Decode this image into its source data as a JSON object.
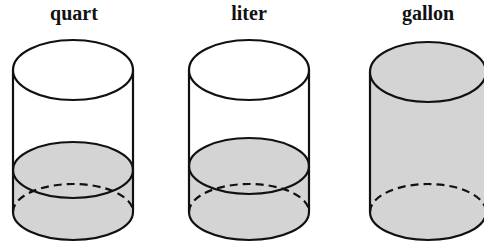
{
  "colors": {
    "liquid": "#d4d4d4",
    "stroke": "#111111",
    "background": "#ffffff"
  },
  "containers": [
    {
      "label": "quart",
      "fill_level": "partial"
    },
    {
      "label": "liter",
      "fill_level": "partial-higher"
    },
    {
      "label": "gallon",
      "fill_level": "full"
    }
  ]
}
